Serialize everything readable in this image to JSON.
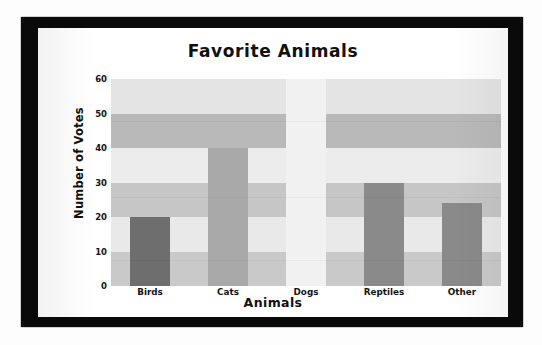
{
  "chart_data": {
    "type": "bar",
    "title": "Favorite Animals",
    "xlabel": "Animals",
    "ylabel": "Number of Votes",
    "categories": [
      "Birds",
      "Cats",
      "Dogs",
      "Reptiles",
      "Other"
    ],
    "values": [
      20,
      40,
      60,
      30,
      24
    ],
    "ylim": [
      0,
      60
    ],
    "yticks": [
      60,
      50,
      40,
      30,
      20,
      10,
      0
    ],
    "ytick_labels": [
      "60",
      "50",
      "40",
      "30",
      "20",
      "10",
      "0"
    ],
    "grid": false,
    "legend": "none",
    "bar_colors": [
      "#6e6e6e",
      "#a9a9a9",
      "#f1f1f1",
      "#8a8a8a",
      "#8a8a8a"
    ],
    "plot_background": "#e2e2e2",
    "background_bands": [
      {
        "from": 60,
        "to": 50,
        "color": "#e4e4e4"
      },
      {
        "from": 50,
        "to": 40,
        "color": "#b9b9b9"
      },
      {
        "from": 40,
        "to": 30,
        "color": "#ececec"
      },
      {
        "from": 30,
        "to": 20,
        "color": "#c6c6c6"
      },
      {
        "from": 20,
        "to": 10,
        "color": "#e9e9e9"
      },
      {
        "from": 10,
        "to": 0,
        "color": "#c9c9c9"
      }
    ]
  },
  "frame": {
    "border_color": "#0a0a0a",
    "mat_color": "#ffffff"
  }
}
